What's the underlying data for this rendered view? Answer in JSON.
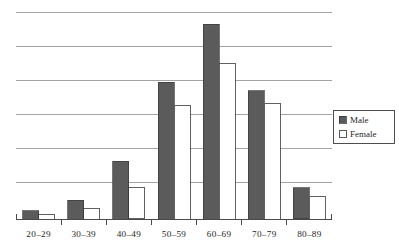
{
  "chart_data": {
    "type": "bar",
    "title": "",
    "subtitle": "",
    "xlabel": "",
    "ylabel": "",
    "categories": [
      "20–29",
      "30–39",
      "40–49",
      "50–59",
      "60–69",
      "70–79",
      "80–89"
    ],
    "series": [
      {
        "name": "Male",
        "values": [
          4,
          9,
          28,
          66,
          94,
          62,
          15
        ]
      },
      {
        "name": "Female",
        "values": [
          2,
          5,
          15,
          55,
          75,
          56,
          11
        ]
      }
    ],
    "ylim": [
      0,
      100
    ],
    "yticks": [
      0,
      16.7,
      33.3,
      50,
      66.7,
      83.3,
      100
    ],
    "ytick_labels": [
      "",
      "",
      "",
      "",
      "",
      "",
      ""
    ],
    "grid": true,
    "grid_axis": "y",
    "legend_position": "right",
    "colors": {
      "male": "#5b5b5b",
      "female": "#ffffff",
      "bar_outline": "#3a3a3a",
      "gridline": "#9a9a9a",
      "axis": "#4a4a4a",
      "text": "#1f1f1f",
      "background": "#ffffff"
    }
  },
  "legend": {
    "entries": [
      {
        "label": "Male",
        "swatch": "filled-square-icon"
      },
      {
        "label": "Female",
        "swatch": "empty-square-icon"
      }
    ]
  },
  "axis": {
    "x_tick_labels": [
      "20–29",
      "30–39",
      "40–49",
      "50–59",
      "60–69",
      "70–79",
      "80–89"
    ]
  }
}
